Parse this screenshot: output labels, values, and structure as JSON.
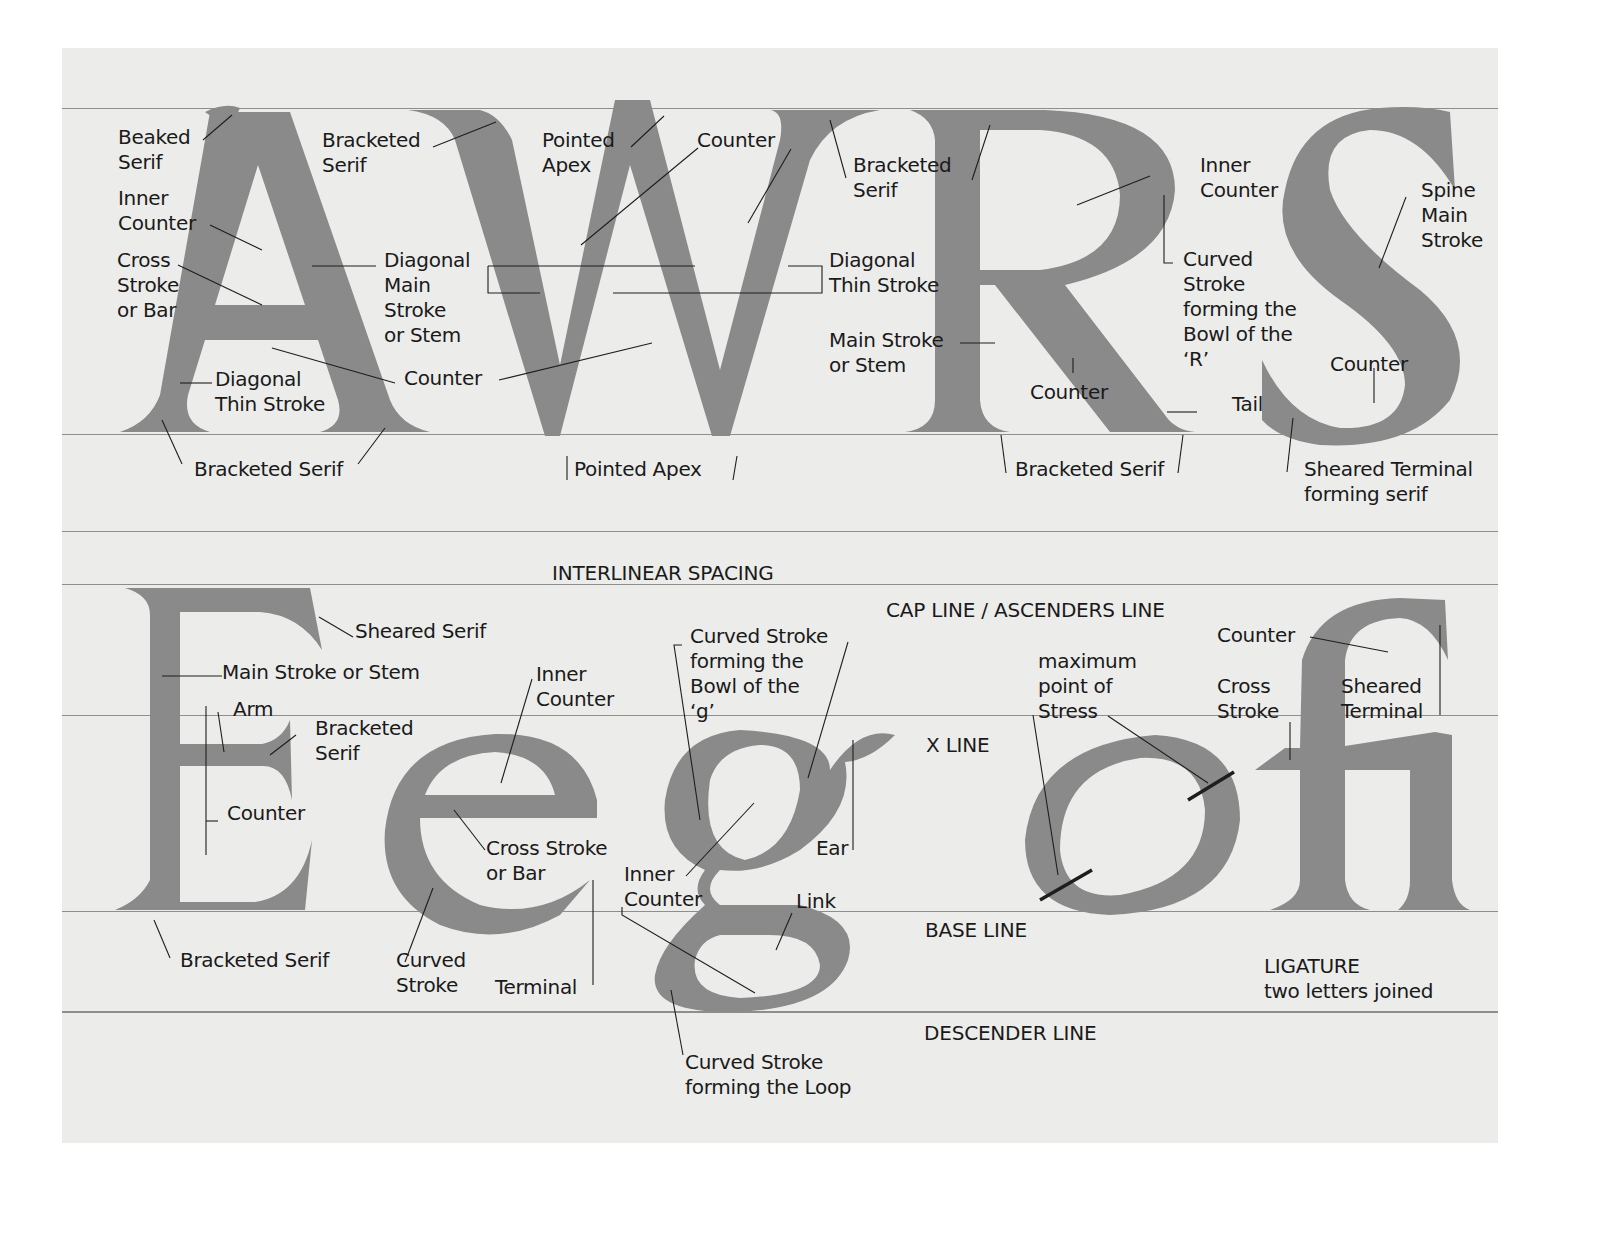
{
  "colors": {
    "background": "#ececea",
    "letter_fill": "#8a8a8a",
    "label_text": "#1a1a1a",
    "guide_line": "#8e8e8e"
  },
  "letters": {
    "row1": [
      "A",
      "W",
      "R",
      "S"
    ],
    "row2": [
      "E",
      "e",
      "g",
      "o",
      "fi"
    ]
  },
  "guides": {
    "interlinear": "INTERLINEAR SPACING",
    "cap_line": "CAP LINE / ASCENDERS LINE",
    "x_line": "X LINE",
    "base_line": "BASE LINE",
    "descender_line": "DESCENDER LINE"
  },
  "labels_A": {
    "beaked_serif": "Beaked\nSerif",
    "inner_counter": "Inner\nCounter",
    "cross_stroke": "Cross\nStroke\nor Bar",
    "diagonal_thin": "Diagonal\nThin Stroke",
    "bracketed_serif_bottom": "Bracketed Serif",
    "diagonal_main": "Diagonal\nMain\nStroke\nor Stem",
    "counter": "Counter"
  },
  "labels_W": {
    "bracketed_serif_left": "Bracketed\nSerif",
    "pointed_apex_top": "Pointed\nApex",
    "counter": "Counter",
    "bracketed_serif_right": "Bracketed\nSerif",
    "diagonal_thin": "Diagonal\nThin Stroke",
    "pointed_apex_bottom": "Pointed Apex"
  },
  "labels_R": {
    "inner_counter": "Inner\nCounter",
    "curved_stroke": "Curved\nStroke\nforming the\nBowl of the\n‘R’",
    "main_stroke": "Main Stroke\nor Stem",
    "counter": "Counter",
    "tail": "Tail",
    "bracketed_serif": "Bracketed Serif"
  },
  "labels_S": {
    "spine": "Spine\nMain\nStroke",
    "counter": "Counter",
    "sheared_terminal": "Sheared Terminal\nforming serif"
  },
  "labels_E": {
    "sheared_serif": "Sheared Serif",
    "main_stroke": "Main Stroke or Stem",
    "arm": "Arm",
    "bracketed_serif": "Bracketed\nSerif",
    "counter": "Counter",
    "bracketed_serif_bottom": "Bracketed Serif"
  },
  "labels_e": {
    "inner_counter": "Inner\nCounter",
    "cross_stroke": "Cross Stroke\nor Bar",
    "curved_stroke": "Curved\nStroke",
    "terminal": "Terminal"
  },
  "labels_g": {
    "curved_bowl": "Curved Stroke\nforming the\nBowl of the\n‘g’",
    "inner_counter": "Inner\nCounter",
    "ear": "Ear",
    "link": "Link",
    "curved_loop": "Curved Stroke\nforming the Loop"
  },
  "labels_o": {
    "stress": "maximum\npoint of\nStress"
  },
  "labels_fi": {
    "counter": "Counter",
    "cross_stroke": "Cross\nStroke",
    "sheared_terminal": "Sheared\nTerminal",
    "ligature": "LIGATURE\ntwo letters joined"
  }
}
